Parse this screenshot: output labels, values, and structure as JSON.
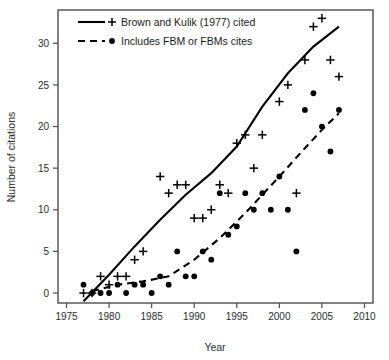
{
  "chart_data": {
    "type": "scatter",
    "title": "",
    "xlabel": "Year",
    "ylabel": "Number of citations",
    "xlim": [
      1974,
      2011
    ],
    "ylim": [
      -1.2,
      34
    ],
    "grid": false,
    "legend_position": "top-left",
    "xticks": [
      1975,
      1980,
      1985,
      1990,
      1995,
      2000,
      2005,
      2010
    ],
    "yticks": [
      0,
      5,
      10,
      15,
      20,
      25,
      30
    ],
    "series": [
      {
        "name": "Brown and Kulik (1977) cited",
        "marker": "plus",
        "line_style": "solid",
        "color": "#000000",
        "points": [
          {
            "x": 1977,
            "y": 0
          },
          {
            "x": 1978,
            "y": 0
          },
          {
            "x": 1979,
            "y": 2
          },
          {
            "x": 1980,
            "y": 1
          },
          {
            "x": 1981,
            "y": 2
          },
          {
            "x": 1982,
            "y": 2
          },
          {
            "x": 1983,
            "y": 4
          },
          {
            "x": 1984,
            "y": 5
          },
          {
            "x": 1986,
            "y": 14
          },
          {
            "x": 1987,
            "y": 12
          },
          {
            "x": 1988,
            "y": 13
          },
          {
            "x": 1989,
            "y": 13
          },
          {
            "x": 1990,
            "y": 9
          },
          {
            "x": 1991,
            "y": 9
          },
          {
            "x": 1992,
            "y": 10
          },
          {
            "x": 1993,
            "y": 13
          },
          {
            "x": 1994,
            "y": 12
          },
          {
            "x": 1995,
            "y": 18
          },
          {
            "x": 1996,
            "y": 19
          },
          {
            "x": 1997,
            "y": 15
          },
          {
            "x": 1998,
            "y": 19
          },
          {
            "x": 2000,
            "y": 23
          },
          {
            "x": 2001,
            "y": 25
          },
          {
            "x": 2002,
            "y": 12
          },
          {
            "x": 2003,
            "y": 28
          },
          {
            "x": 2004,
            "y": 32
          },
          {
            "x": 2005,
            "y": 33
          },
          {
            "x": 2006,
            "y": 28
          },
          {
            "x": 2007,
            "y": 26
          }
        ],
        "trend_line": [
          {
            "x": 1977,
            "y": -1.0
          },
          {
            "x": 1980,
            "y": 2.2
          },
          {
            "x": 1983,
            "y": 5.6
          },
          {
            "x": 1986,
            "y": 8.8
          },
          {
            "x": 1989,
            "y": 11.8
          },
          {
            "x": 1992,
            "y": 14.4
          },
          {
            "x": 1995,
            "y": 17.6
          },
          {
            "x": 1998,
            "y": 22.4
          },
          {
            "x": 2001,
            "y": 26.4
          },
          {
            "x": 2004,
            "y": 29.6
          },
          {
            "x": 2007,
            "y": 32.0
          }
        ]
      },
      {
        "name": "Includes FBM or FBMs cites",
        "marker": "dot",
        "line_style": "dashed",
        "color": "#000000",
        "points": [
          {
            "x": 1977,
            "y": 1
          },
          {
            "x": 1978,
            "y": 0
          },
          {
            "x": 1979,
            "y": 0
          },
          {
            "x": 1980,
            "y": 0
          },
          {
            "x": 1981,
            "y": 1
          },
          {
            "x": 1982,
            "y": 0
          },
          {
            "x": 1983,
            "y": 1
          },
          {
            "x": 1984,
            "y": 1
          },
          {
            "x": 1985,
            "y": 0
          },
          {
            "x": 1986,
            "y": 2
          },
          {
            "x": 1987,
            "y": 1
          },
          {
            "x": 1988,
            "y": 5
          },
          {
            "x": 1989,
            "y": 2
          },
          {
            "x": 1990,
            "y": 2
          },
          {
            "x": 1991,
            "y": 5
          },
          {
            "x": 1992,
            "y": 4
          },
          {
            "x": 1993,
            "y": 12
          },
          {
            "x": 1994,
            "y": 7
          },
          {
            "x": 1995,
            "y": 8
          },
          {
            "x": 1996,
            "y": 12
          },
          {
            "x": 1997,
            "y": 10
          },
          {
            "x": 1998,
            "y": 12
          },
          {
            "x": 1999,
            "y": 10
          },
          {
            "x": 2000,
            "y": 14
          },
          {
            "x": 2001,
            "y": 10
          },
          {
            "x": 2002,
            "y": 5
          },
          {
            "x": 2003,
            "y": 22
          },
          {
            "x": 2004,
            "y": 24
          },
          {
            "x": 2005,
            "y": 20
          },
          {
            "x": 2006,
            "y": 17
          },
          {
            "x": 2007,
            "y": 22
          }
        ],
        "trend_line": [
          {
            "x": 1978,
            "y": 0.2
          },
          {
            "x": 1981,
            "y": 1.0
          },
          {
            "x": 1984,
            "y": 1.4
          },
          {
            "x": 1987,
            "y": 2.0
          },
          {
            "x": 1990,
            "y": 4.0
          },
          {
            "x": 1993,
            "y": 6.6
          },
          {
            "x": 1996,
            "y": 9.6
          },
          {
            "x": 1998,
            "y": 11.8
          },
          {
            "x": 2000,
            "y": 14.0
          },
          {
            "x": 2003,
            "y": 17.4
          },
          {
            "x": 2005,
            "y": 19.6
          },
          {
            "x": 2007,
            "y": 21.6
          }
        ]
      }
    ]
  },
  "legend": {
    "items": [
      {
        "label": "Brown and Kulik (1977) cited",
        "marker": "plus",
        "line_style": "solid"
      },
      {
        "label": "Includes FBM or FBMs cites",
        "marker": "dot",
        "line_style": "dashed"
      }
    ]
  },
  "axes": {
    "x_title": "Year",
    "y_title": "Number of citations",
    "x_tick_labels": [
      "1975",
      "1980",
      "1985",
      "1990",
      "1995",
      "2000",
      "2005",
      "2010"
    ],
    "y_tick_labels": [
      "0",
      "5",
      "10",
      "15",
      "20",
      "25",
      "30"
    ]
  },
  "colors": {
    "foreground": "#000000",
    "axis": "#4d4d4d",
    "background": "#ffffff"
  }
}
